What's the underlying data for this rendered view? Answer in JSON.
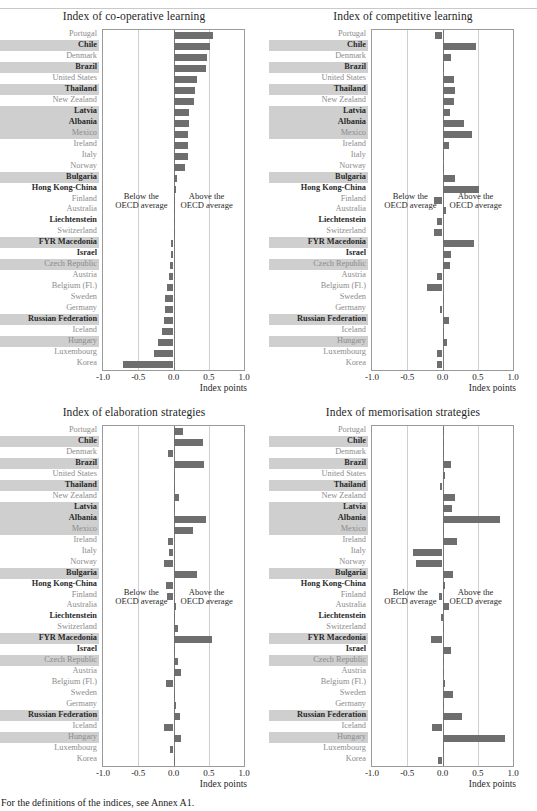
{
  "page": {
    "footer_note": "For the definitions of the indices, see Annex A1.",
    "ghost_top": "",
    "axis_title": "Index points",
    "note_below": "Below the\nOECD average",
    "note_below_line1": "Below the",
    "note_below_line2": "OECD average",
    "note_above_line1": "Above the",
    "note_above_line2": "OECD average",
    "bar_color": "#6e6e6e",
    "highlight_color": "#cfcfcf",
    "tick_labels": [
      "-1.0",
      "-0.5",
      "0.0",
      "0.5",
      "1.0"
    ]
  },
  "countries": [
    {
      "name": "Portugal",
      "bold": false,
      "highlight": false
    },
    {
      "name": "Chile",
      "bold": true,
      "highlight": true
    },
    {
      "name": "Denmark",
      "bold": false,
      "highlight": false
    },
    {
      "name": "Brazil",
      "bold": true,
      "highlight": true
    },
    {
      "name": "United States",
      "bold": false,
      "highlight": false
    },
    {
      "name": "Thailand",
      "bold": true,
      "highlight": true
    },
    {
      "name": "New Zealand",
      "bold": false,
      "highlight": false
    },
    {
      "name": "Latvia",
      "bold": true,
      "highlight": true
    },
    {
      "name": "Albania",
      "bold": true,
      "highlight": true
    },
    {
      "name": "Mexico",
      "bold": false,
      "highlight": true
    },
    {
      "name": "Ireland",
      "bold": false,
      "highlight": false
    },
    {
      "name": "Italy",
      "bold": false,
      "highlight": false
    },
    {
      "name": "Norway",
      "bold": false,
      "highlight": false
    },
    {
      "name": "Bulgaria",
      "bold": true,
      "highlight": true
    },
    {
      "name": "Hong Kong-China",
      "bold": true,
      "highlight": false
    },
    {
      "name": "Finland",
      "bold": false,
      "highlight": false
    },
    {
      "name": "Australia",
      "bold": false,
      "highlight": false
    },
    {
      "name": "Liechtenstein",
      "bold": true,
      "highlight": false
    },
    {
      "name": "Switzerland",
      "bold": false,
      "highlight": false
    },
    {
      "name": "FYR Macedonia",
      "bold": true,
      "highlight": true
    },
    {
      "name": "Israel",
      "bold": true,
      "highlight": false
    },
    {
      "name": "Czech Republic",
      "bold": false,
      "highlight": true
    },
    {
      "name": "Austria",
      "bold": false,
      "highlight": false
    },
    {
      "name": "Belgium (Fl.)",
      "bold": false,
      "highlight": false
    },
    {
      "name": "Sweden",
      "bold": false,
      "highlight": false
    },
    {
      "name": "Germany",
      "bold": false,
      "highlight": false
    },
    {
      "name": "Russian Federation",
      "bold": true,
      "highlight": true
    },
    {
      "name": "Iceland",
      "bold": false,
      "highlight": false
    },
    {
      "name": "Hungary",
      "bold": false,
      "highlight": true
    },
    {
      "name": "Luxembourg",
      "bold": false,
      "highlight": false
    },
    {
      "name": "Korea",
      "bold": false,
      "highlight": false
    }
  ],
  "chart_data": [
    {
      "type": "bar",
      "orientation": "horizontal",
      "title": "Index of co-operative learning",
      "xlabel": "Index points",
      "ylabel": "",
      "xlim": [
        -1.0,
        1.0
      ],
      "xticks": [
        -1.0,
        -0.5,
        0.0,
        0.5,
        1.0
      ],
      "grid": true,
      "categories": [
        "Portugal",
        "Chile",
        "Denmark",
        "Brazil",
        "United States",
        "Thailand",
        "New Zealand",
        "Latvia",
        "Albania",
        "Mexico",
        "Ireland",
        "Italy",
        "Norway",
        "Bulgaria",
        "Hong Kong-China",
        "Finland",
        "Australia",
        "Liechtenstein",
        "Switzerland",
        "FYR Macedonia",
        "Israel",
        "Czech Republic",
        "Austria",
        "Belgium (Fl.)",
        "Sweden",
        "Germany",
        "Russian Federation",
        "Iceland",
        "Hungary",
        "Luxembourg",
        "Korea"
      ],
      "values": [
        0.56,
        0.52,
        0.47,
        0.46,
        0.33,
        0.3,
        0.29,
        0.22,
        0.22,
        0.21,
        0.2,
        0.2,
        0.16,
        0.05,
        0.03,
        0.02,
        0.02,
        0.0,
        0.0,
        -0.03,
        -0.04,
        -0.05,
        -0.07,
        -0.09,
        -0.12,
        -0.12,
        -0.13,
        -0.17,
        -0.22,
        -0.28,
        -0.72
      ]
    },
    {
      "type": "bar",
      "orientation": "horizontal",
      "title": "Index of competitive learning",
      "xlabel": "Index points",
      "ylabel": "",
      "xlim": [
        -1.0,
        1.0
      ],
      "xticks": [
        -1.0,
        -0.5,
        0.0,
        0.5,
        1.0
      ],
      "grid": true,
      "categories": [
        "Portugal",
        "Chile",
        "Denmark",
        "Brazil",
        "United States",
        "Thailand",
        "New Zealand",
        "Latvia",
        "Albania",
        "Mexico",
        "Ireland",
        "Italy",
        "Norway",
        "Bulgaria",
        "Hong Kong-China",
        "Finland",
        "Australia",
        "Liechtenstein",
        "Switzerland",
        "FYR Macedonia",
        "Israel",
        "Czech Republic",
        "Austria",
        "Belgium (Fl.)",
        "Sweden",
        "Germany",
        "Russian Federation",
        "Iceland",
        "Hungary",
        "Luxembourg",
        "Korea"
      ],
      "values": [
        -0.11,
        0.47,
        0.12,
        0.01,
        0.16,
        0.18,
        0.17,
        0.11,
        0.3,
        0.42,
        0.09,
        0.01,
        0.01,
        0.18,
        0.52,
        -0.12,
        0.05,
        -0.08,
        -0.12,
        0.45,
        0.12,
        0.1,
        -0.08,
        -0.22,
        0.0,
        -0.03,
        0.09,
        0.01,
        0.07,
        -0.08,
        -0.08
      ]
    },
    {
      "type": "bar",
      "orientation": "horizontal",
      "title": "Index of elaboration strategies",
      "xlabel": "Index points",
      "ylabel": "",
      "xlim": [
        -1.0,
        1.0
      ],
      "xticks": [
        -1.0,
        -0.5,
        0.0,
        0.5,
        1.0
      ],
      "grid": true,
      "categories": [
        "Portugal",
        "Chile",
        "Denmark",
        "Brazil",
        "United States",
        "Thailand",
        "New Zealand",
        "Latvia",
        "Albania",
        "Mexico",
        "Ireland",
        "Italy",
        "Norway",
        "Bulgaria",
        "Hong Kong-China",
        "Finland",
        "Australia",
        "Liechtenstein",
        "Switzerland",
        "FYR Macedonia",
        "Israel",
        "Czech Republic",
        "Austria",
        "Belgium (Fl.)",
        "Sweden",
        "Germany",
        "Russian Federation",
        "Iceland",
        "Hungary",
        "Luxembourg",
        "Korea"
      ],
      "values": [
        0.14,
        0.42,
        -0.08,
        0.43,
        0.0,
        0.0,
        0.08,
        0.01,
        0.46,
        0.28,
        -0.08,
        -0.07,
        -0.13,
        0.34,
        -0.11,
        -0.09,
        0.04,
        0.0,
        0.06,
        0.55,
        0.0,
        0.07,
        0.11,
        -0.1,
        0.0,
        0.04,
        0.09,
        -0.14,
        0.1,
        -0.05,
        0.0
      ]
    },
    {
      "type": "bar",
      "orientation": "horizontal",
      "title": "Index of memorisation strategies",
      "xlabel": "Index points",
      "ylabel": "",
      "xlim": [
        -1.0,
        1.0
      ],
      "xticks": [
        -1.0,
        -0.5,
        0.0,
        0.5,
        1.0
      ],
      "grid": true,
      "categories": [
        "Portugal",
        "Chile",
        "Denmark",
        "Brazil",
        "United States",
        "Thailand",
        "New Zealand",
        "Latvia",
        "Albania",
        "Mexico",
        "Ireland",
        "Italy",
        "Norway",
        "Bulgaria",
        "Hong Kong-China",
        "Finland",
        "Australia",
        "Liechtenstein",
        "Switzerland",
        "FYR Macedonia",
        "Israel",
        "Czech Republic",
        "Austria",
        "Belgium (Fl.)",
        "Sweden",
        "Germany",
        "Russian Federation",
        "Iceland",
        "Hungary",
        "Luxembourg",
        "Korea"
      ],
      "values": [
        0.01,
        0.0,
        0.02,
        0.12,
        0.04,
        -0.04,
        0.18,
        0.14,
        0.82,
        0.02,
        0.21,
        -0.42,
        -0.37,
        0.15,
        0.03,
        -0.05,
        0.09,
        -0.02,
        0.0,
        -0.17,
        0.12,
        0.01,
        0.0,
        0.04,
        0.15,
        0.01,
        0.28,
        -0.15,
        0.88,
        0.01,
        -0.07
      ]
    }
  ]
}
